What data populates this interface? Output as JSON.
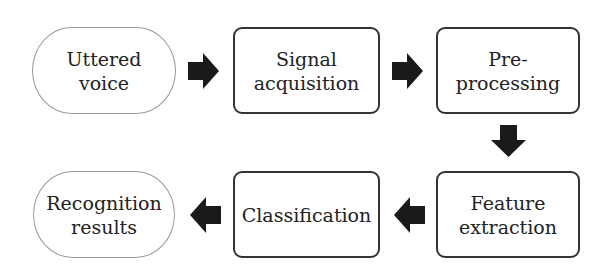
{
  "diagram": {
    "title": "",
    "nodes": [
      {
        "id": "uttered-voice",
        "label": "Uttered\nvoice",
        "shape": "rounded-terminal"
      },
      {
        "id": "signal-acquisition",
        "label": "Signal\nacquisition",
        "shape": "rect"
      },
      {
        "id": "pre-processing",
        "label": "Pre-\nprocessing",
        "shape": "rect"
      },
      {
        "id": "feature-extraction",
        "label": "Feature\nextraction",
        "shape": "rect"
      },
      {
        "id": "classification",
        "label": "Classification",
        "shape": "rect"
      },
      {
        "id": "recognition-results",
        "label": "Recognition\nresults",
        "shape": "rounded-terminal"
      }
    ],
    "edges": [
      {
        "from": "uttered-voice",
        "to": "signal-acquisition",
        "direction": "right"
      },
      {
        "from": "signal-acquisition",
        "to": "pre-processing",
        "direction": "right"
      },
      {
        "from": "pre-processing",
        "to": "feature-extraction",
        "direction": "down"
      },
      {
        "from": "feature-extraction",
        "to": "classification",
        "direction": "left"
      },
      {
        "from": "classification",
        "to": "recognition-results",
        "direction": "left"
      }
    ],
    "colors": {
      "arrow": "#1a1a1a",
      "box_border": "#333333",
      "terminal_border": "#999999",
      "text": "#222222"
    }
  }
}
